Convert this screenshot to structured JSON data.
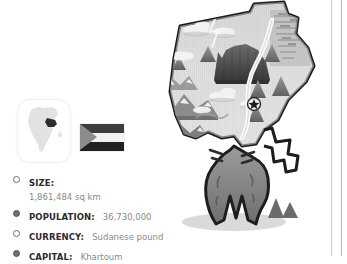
{
  "country": {
    "name": "Sudan",
    "region": "Africa"
  },
  "emblems": {
    "locator_map": {
      "icon": "africa-continent-icon",
      "highlight_label": "Sudan"
    },
    "flag": {
      "icon": "sudan-flag-icon",
      "hoist_shape": "triangle",
      "band_colors": [
        "#3d3d3d",
        "#f2f2f2",
        "#222222"
      ],
      "hoist_color": "#8c8c8c"
    }
  },
  "facts": [
    {
      "bullet": "hollow",
      "label": "SIZE:",
      "value": "1,861,484 sq km",
      "layout": "stacked"
    },
    {
      "bullet": "filled",
      "label": "POPULATION:",
      "value": "36,730,000",
      "layout": "inline"
    },
    {
      "bullet": "hollow",
      "label": "CURRENCY:",
      "value": "Sudanese pound",
      "layout": "inline"
    },
    {
      "bullet": "filled",
      "label": "CAPITAL:",
      "value": "Khartoum",
      "layout": "inline"
    }
  ],
  "map": {
    "title": "Sudan relief map illustration",
    "style": "grayscale",
    "features": [
      "country-outline",
      "mesa-plateau",
      "mountain-peaks",
      "mountain-ranges",
      "clouds",
      "nile-river",
      "capital-star-marker",
      "hatched-highlands"
    ],
    "capital_marker": {
      "icon": "capital-star-icon",
      "label": "Khartoum"
    },
    "colors": {
      "outline": "#1d1d1d",
      "land_light": "#e4e4e4",
      "land_mid": "#c3c3c3",
      "land_dark": "#7a7a7a",
      "mesa": "#4a4a4a"
    }
  },
  "page": {
    "rule_color": "#b9b9b9"
  }
}
